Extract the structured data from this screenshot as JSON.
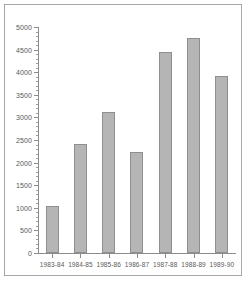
{
  "chart_data": {
    "type": "bar",
    "title": "",
    "subtitle": "",
    "xlabel": "",
    "ylabel": "",
    "categories": [
      "1983-84",
      "1984-85",
      "1985-86",
      "1986-87",
      "1987-88",
      "1988-89",
      "1989-90"
    ],
    "values": [
      1050,
      2410,
      3110,
      2240,
      4450,
      4760,
      3910
    ],
    "series": [
      {
        "name": "",
        "values": [
          1050,
          2410,
          3110,
          2240,
          4450,
          4760,
          3910
        ]
      }
    ],
    "ylim": [
      0,
      5000
    ],
    "xlim": [
      0,
      7
    ],
    "ytick_labels": [
      "0",
      "500",
      "1000",
      "1500",
      "2000",
      "2500",
      "3000",
      "3500",
      "4000",
      "4500",
      "5000"
    ],
    "ytick_values": [
      0,
      500,
      1000,
      1500,
      2000,
      2500,
      3000,
      3500,
      4000,
      4500,
      5000
    ],
    "yminor_step": 100,
    "grid": false,
    "legend": null,
    "legend_position": "none",
    "annotations": [],
    "colors": {
      "bar_fill": "#b5b5b5",
      "bar_edge": "#8f8f8f",
      "axis": "#8c8c8c",
      "tick_text": "#5a5a5a",
      "frame": "#a8a8a8",
      "background": "#ffffff"
    }
  }
}
